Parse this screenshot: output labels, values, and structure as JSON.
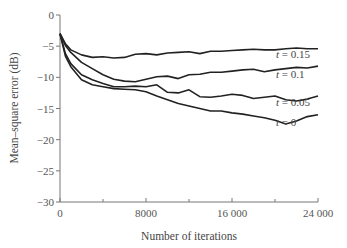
{
  "chart_data": {
    "type": "line",
    "title": "",
    "xlabel": "Number of iterations",
    "ylabel": "Mean–square error (dB)",
    "xlim": [
      0,
      24000
    ],
    "ylim": [
      -30,
      0
    ],
    "x_ticks": [
      0,
      8000,
      16000,
      24000
    ],
    "x_tick_labels": [
      "0",
      "8000",
      "16 000",
      "24 000"
    ],
    "x_minor_ticks": [
      4000,
      12000,
      20000
    ],
    "y_ticks": [
      0,
      -5,
      -10,
      -15,
      -20,
      -25,
      -30
    ],
    "y_tick_labels": [
      "0",
      "−5",
      "−10",
      "−15",
      "−20",
      "−25",
      "−30"
    ],
    "grid": false,
    "legend": "inline labels at right end of curves",
    "x": [
      0,
      500,
      1000,
      2000,
      3000,
      4000,
      5000,
      6000,
      7000,
      8000,
      9000,
      10000,
      11000,
      12000,
      13000,
      14000,
      15000,
      16000,
      17000,
      18000,
      19000,
      20000,
      21000,
      22000,
      23000,
      24000
    ],
    "series": [
      {
        "name": "t = 0.15",
        "label": "t = 0.15",
        "values": [
          -3,
          -4.6,
          -5.6,
          -6.4,
          -6.8,
          -6.7,
          -6.9,
          -6.8,
          -6.3,
          -6.2,
          -6.4,
          -6.1,
          -6.0,
          -5.9,
          -6.2,
          -5.8,
          -5.8,
          -5.7,
          -5.6,
          -5.5,
          -5.6,
          -5.6,
          -5.4,
          -5.3,
          -5.4,
          -5.4
        ]
      },
      {
        "name": "t = 0.1",
        "label": "t = 0.1",
        "values": [
          -3,
          -4.9,
          -6.0,
          -7.6,
          -8.6,
          -9.6,
          -10.3,
          -10.6,
          -10.7,
          -10.3,
          -9.9,
          -9.8,
          -10.2,
          -9.6,
          -9.5,
          -9.2,
          -9.2,
          -9.0,
          -8.8,
          -8.7,
          -9.1,
          -8.8,
          -8.6,
          -8.4,
          -8.5,
          -8.2
        ]
      },
      {
        "name": "t = 0.05",
        "label": "t = 0.05",
        "values": [
          -3,
          -6.2,
          -7.8,
          -9.6,
          -10.4,
          -11.0,
          -11.5,
          -11.5,
          -11.4,
          -11.5,
          -11.2,
          -12.4,
          -12.5,
          -12.0,
          -13.1,
          -13.2,
          -13.0,
          -12.7,
          -12.9,
          -13.4,
          -13.2,
          -13.0,
          -13.6,
          -13.8,
          -13.5,
          -13.0
        ]
      },
      {
        "name": "t = 0",
        "label": "t = 0",
        "values": [
          -3,
          -6.6,
          -8.3,
          -10.4,
          -11.2,
          -11.5,
          -11.8,
          -11.9,
          -12.0,
          -12.3,
          -13.0,
          -13.6,
          -14.2,
          -14.6,
          -15.0,
          -15.4,
          -15.4,
          -15.7,
          -15.9,
          -16.2,
          -16.5,
          -16.9,
          -17.5,
          -17.0,
          -16.3,
          -16.0
        ]
      }
    ]
  }
}
